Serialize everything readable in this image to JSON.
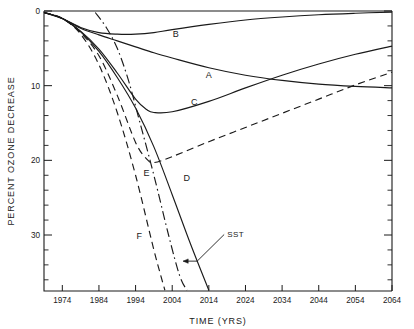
{
  "chart_data": {
    "type": "line",
    "title": "",
    "xlabel": "TIME  (YRS)",
    "ylabel": "PERCENT OZONE DECREASE",
    "xlim": [
      1969,
      2064
    ],
    "ylim": [
      37.5,
      0
    ],
    "y_axis_inverted": true,
    "grid": false,
    "legend_position": "inline-labels",
    "xticks": [
      1974,
      1984,
      1994,
      2004,
      2014,
      2024,
      2034,
      2044,
      2054,
      2064
    ],
    "xtick_labels": [
      "1974",
      "1984",
      "1994",
      "2004",
      "2014",
      "2024",
      "2034",
      "2044",
      "2054",
      "2064"
    ],
    "x_minor_tick_interval": 2,
    "yticks": [
      0,
      10,
      20,
      30
    ],
    "ytick_labels": [
      "0",
      "10",
      "20",
      "30"
    ],
    "y_minor_tick_interval": 2,
    "series": [
      {
        "name": "A",
        "label": "A",
        "style": "solid",
        "label_x": 2014,
        "label_y": 8.6,
        "x": [
          1969,
          1974,
          1979,
          1984,
          1989,
          1994,
          1999,
          2004,
          2014,
          2024,
          2034,
          2044,
          2054,
          2064
        ],
        "y": [
          0.2,
          1.0,
          2.3,
          3.2,
          4.0,
          4.8,
          5.6,
          6.3,
          7.6,
          8.6,
          9.3,
          9.8,
          10.1,
          10.3
        ]
      },
      {
        "name": "B",
        "label": "B",
        "style": "solid",
        "label_x": 2005,
        "label_y": 3.1,
        "x": [
          1969,
          1974,
          1979,
          1984,
          1989,
          1994,
          1999,
          2004,
          2014,
          2024,
          2034,
          2044,
          2054,
          2064
        ],
        "y": [
          0.2,
          1.0,
          2.2,
          2.9,
          3.1,
          3.1,
          2.9,
          2.5,
          1.8,
          1.2,
          0.8,
          0.5,
          0.3,
          0.15
        ]
      },
      {
        "name": "C",
        "label": "C",
        "style": "solid",
        "label_x": 2010,
        "label_y": 12.2,
        "x": [
          1969,
          1974,
          1979,
          1984,
          1989,
          1994,
          1997,
          1999,
          2004,
          2014,
          2024,
          2034,
          2044,
          2054,
          2064
        ],
        "y": [
          0.2,
          1.0,
          2.7,
          5.1,
          8.3,
          11.8,
          13.2,
          13.6,
          13.5,
          12.1,
          10.3,
          8.6,
          7.1,
          5.8,
          4.7
        ]
      },
      {
        "name": "D",
        "label": "D",
        "style": "solid",
        "label_x": 2008,
        "label_y": 22.3,
        "x": [
          1969,
          1974,
          1979,
          1984,
          1989,
          1994,
          1999,
          2004,
          2009,
          2014
        ],
        "y": [
          0.2,
          1.0,
          2.8,
          5.4,
          8.9,
          13.0,
          18.2,
          24.6,
          31.2,
          37.4
        ]
      },
      {
        "name": "E",
        "label": "E",
        "style": "dashed",
        "label_x": 1997,
        "label_y": 21.7,
        "x": [
          1969,
          1974,
          1979,
          1984,
          1989,
          1994,
          1997,
          1999,
          2004,
          2014,
          2024,
          2034,
          2044,
          2054,
          2064
        ],
        "y": [
          0.2,
          1.0,
          2.9,
          6.0,
          11.3,
          17.6,
          19.8,
          20.3,
          19.5,
          17.5,
          15.6,
          13.7,
          11.8,
          9.9,
          8.2
        ]
      },
      {
        "name": "F",
        "label": "F",
        "style": "dashed",
        "label_x": 1995,
        "label_y": 30.2,
        "x": [
          1969,
          1974,
          1979,
          1984,
          1989,
          1994,
          1999,
          2002
        ],
        "y": [
          0.2,
          1.0,
          3.1,
          7.2,
          13.6,
          22.0,
          32.0,
          37.4
        ]
      },
      {
        "name": "SST",
        "label": "SST",
        "style": "dash-dot",
        "label_x": 2019,
        "label_y": 29.8,
        "annotation_target_x": 2007,
        "annotation_target_y": 33.5,
        "x": [
          1983,
          1986,
          1989,
          1992,
          1995,
          1999,
          2003,
          2006,
          2008
        ],
        "y": [
          0.2,
          2.2,
          5.0,
          9.2,
          14.6,
          22.0,
          30.0,
          35.4,
          37.4
        ]
      }
    ]
  },
  "curve_labels": {
    "a": "A",
    "b": "B",
    "c": "C",
    "d": "D",
    "e": "E",
    "f": "F",
    "sst": "SST"
  },
  "axes": {
    "x_title": "TIME  (YRS)",
    "y_title": "PERCENT OZONE DECREASE"
  },
  "colors": {
    "ink": "#1a1a1a",
    "background": "#ffffff"
  }
}
